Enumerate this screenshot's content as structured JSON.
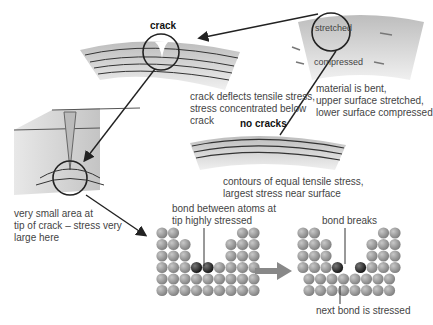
{
  "labels": {
    "crack_title": "crack",
    "crack_desc": [
      "crack deflects tensile stress,",
      "stress concentrated below",
      "crack"
    ],
    "bent_stretched": "stretched",
    "bent_compressed": "compressed",
    "bent_desc": [
      "material is bent,",
      "upper surface stretched,",
      "lower surface compressed"
    ],
    "no_cracks_title": "no cracks",
    "no_cracks_desc": [
      "contours of equal tensile stress,",
      "largest stress near surface"
    ],
    "tip_desc": [
      "very small area at",
      "tip of crack – stress very",
      "large here"
    ],
    "bond_stressed": [
      "bond between atoms at",
      "tip highly stressed"
    ],
    "bond_breaks": "bond breaks",
    "next_bond": "next bond is stressed"
  },
  "colors": {
    "material": "#c9c9c9",
    "atom": "#8f8f8f",
    "atom_dark": "#333333",
    "line": "#222222",
    "arrow": "#888888"
  }
}
